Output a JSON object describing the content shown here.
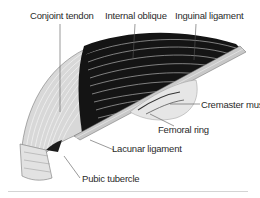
{
  "diagram": {
    "labels": {
      "conjoint_tendon": "Conjoint tendon",
      "internal_oblique": "Internal oblique",
      "inguinal_ligament": "Inguinal ligament",
      "cremaster_muscle": "Cremaster muscle",
      "femoral_ring": "Femoral ring",
      "lacunar_ligament": "Lacunar ligament",
      "pubic_tubercle": "Pubic tubercle"
    },
    "colors": {
      "muscle_dark": "#141414",
      "tendon_light": "#d8d8d8",
      "fiber_line": "#f2f2f2",
      "leader_line": "#555555",
      "text": "#2a2a2a"
    }
  }
}
